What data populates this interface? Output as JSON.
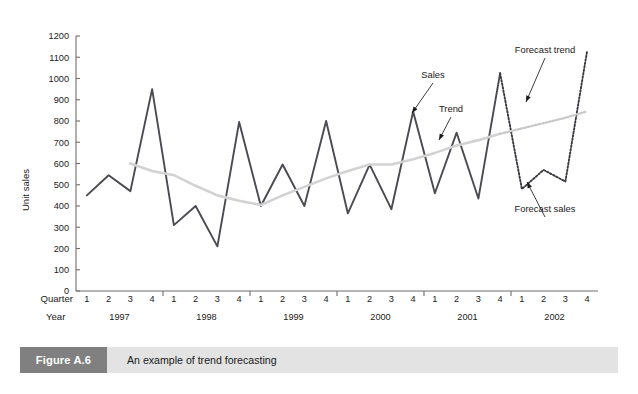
{
  "figure": {
    "tag": "Figure A.6",
    "caption": "An example of trend forecasting"
  },
  "chart_data": {
    "type": "line",
    "title": "",
    "xlabel": "",
    "ylabel": "Unit sales",
    "ylim": [
      0,
      1200
    ],
    "ytick_step": 100,
    "yticks": [
      0,
      100,
      200,
      300,
      400,
      500,
      600,
      700,
      800,
      900,
      1000,
      1100,
      1200
    ],
    "grid": false,
    "legend": "annotations",
    "axis_row_labels": {
      "quarter": "Quarter",
      "year": "Year"
    },
    "years": [
      "1997",
      "1998",
      "1999",
      "2000",
      "2001",
      "2002"
    ],
    "quarters": [
      "1",
      "2",
      "3",
      "4"
    ],
    "x": [
      "1997 Q1",
      "1997 Q2",
      "1997 Q3",
      "1997 Q4",
      "1998 Q1",
      "1998 Q2",
      "1998 Q3",
      "1998 Q4",
      "1999 Q1",
      "1999 Q2",
      "1999 Q3",
      "1999 Q4",
      "2000 Q1",
      "2000 Q2",
      "2000 Q3",
      "2000 Q4",
      "2001 Q1",
      "2001 Q2",
      "2001 Q3",
      "2001 Q4",
      "2002 Q1",
      "2002 Q2",
      "2002 Q3",
      "2002 Q4"
    ],
    "series": [
      {
        "name": "Sales",
        "style": "solid",
        "color": "#4a4a52",
        "values": [
          450,
          545,
          470,
          950,
          310,
          400,
          210,
          795,
          400,
          595,
          400,
          800,
          365,
          595,
          385,
          845,
          460,
          745,
          435,
          1025,
          null,
          null,
          null,
          null
        ]
      },
      {
        "name": "Trend",
        "style": "solid",
        "color": "#d2d2d2",
        "values": [
          null,
          null,
          600,
          565,
          545,
          495,
          450,
          425,
          405,
          450,
          490,
          530,
          565,
          595,
          595,
          620,
          650,
          685,
          710,
          740,
          null,
          null,
          null,
          null
        ]
      },
      {
        "name": "Forecast sales",
        "style": "dotted",
        "color": "#3a3a42",
        "values": [
          null,
          null,
          null,
          null,
          null,
          null,
          null,
          null,
          null,
          null,
          null,
          null,
          null,
          null,
          null,
          null,
          null,
          null,
          null,
          1025,
          480,
          570,
          515,
          1130
        ]
      },
      {
        "name": "Forecast trend",
        "style": "dotted",
        "color": "#c9c9c9",
        "values": [
          null,
          null,
          null,
          null,
          null,
          null,
          null,
          null,
          null,
          null,
          null,
          null,
          null,
          null,
          null,
          null,
          null,
          null,
          null,
          740,
          765,
          790,
          815,
          845
        ]
      }
    ],
    "annotations": [
      {
        "label": "Sales",
        "target": "2000 Q4"
      },
      {
        "label": "Trend",
        "target": "2001 Q1"
      },
      {
        "label": "Forecast trend",
        "target": "2002 Q2"
      },
      {
        "label": "Forecast sales",
        "target": "2002 Q2"
      }
    ]
  }
}
